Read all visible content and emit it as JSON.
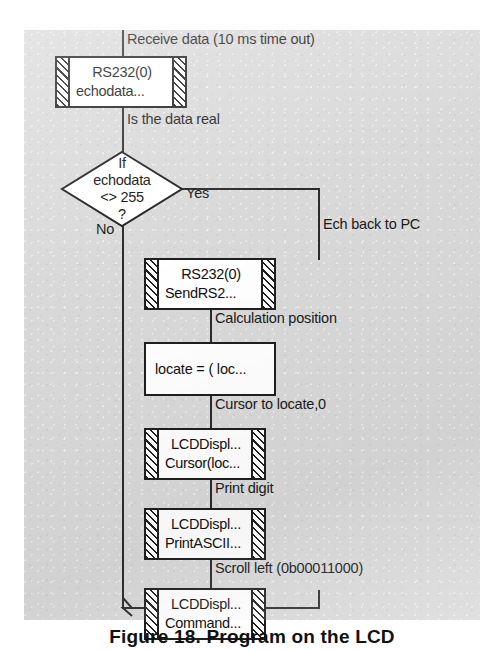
{
  "figure": {
    "caption": "Figure 18. Program on the  LCD",
    "canvas_bg": "#d9d9d9",
    "line_color": "#2b2b2b"
  },
  "flowchart": {
    "type": "flowchart",
    "title": "Receive data / echo / print digit on LCD",
    "edge_labels": {
      "receive": "Receive data (10 ms time out)",
      "is_real": "Is the data real",
      "yes": "Yes",
      "no": "No",
      "echo_back": "Ech back to PC",
      "calc_position": "Calculation position",
      "cursor_to": "Cursor to locate,0",
      "print_digit": "Print digit",
      "scroll_left": "Scroll left (0b00011000)"
    },
    "nodes": [
      {
        "id": "rs232_echo",
        "shape": "predefined-process",
        "line1": "RS232(0)",
        "line2": "echodata..."
      },
      {
        "id": "decision",
        "shape": "decision",
        "line1": "If",
        "line2": "echodata",
        "line3": "<> 255",
        "line4": "?"
      },
      {
        "id": "rs232_send",
        "shape": "predefined-process",
        "line1": "RS232(0)",
        "line2": "SendRS2..."
      },
      {
        "id": "locate_calc",
        "shape": "process",
        "line1": "locate = ( loc..."
      },
      {
        "id": "lcd_cursor",
        "shape": "predefined-process",
        "line1": "LCDDispl...",
        "line2": "Cursor(loc..."
      },
      {
        "id": "lcd_print",
        "shape": "predefined-process",
        "line1": "LCDDispl...",
        "line2": "PrintASCII..."
      },
      {
        "id": "lcd_command",
        "shape": "predefined-process",
        "line1": "LCDDispl...",
        "line2": "Command..."
      }
    ]
  }
}
